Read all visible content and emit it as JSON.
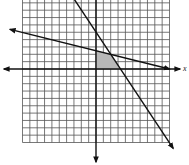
{
  "chart_data": {
    "type": "line",
    "title": "",
    "xlabel": "x",
    "ylabel": "",
    "grid": true,
    "grid_range": {
      "x": [
        -10,
        10
      ],
      "y": [
        -10,
        9
      ]
    },
    "axes": {
      "x_axis": "y=0",
      "y_axis": "x=0"
    },
    "series": [
      {
        "name": "steep line",
        "equation": "y = -1.5x + 5",
        "slope": -1.5,
        "intercept": 5,
        "points": [
          [
            -3.3,
            10
          ],
          [
            10.5,
            -10.8
          ]
        ]
      },
      {
        "name": "shallow line",
        "equation": "y = -0.25x + 2.5",
        "slope": -0.25,
        "intercept": 2.5,
        "points": [
          [
            -11.7,
            5.4
          ],
          [
            10,
            0
          ]
        ]
      }
    ],
    "shaded_region": {
      "description": "feasible region bounded by axes and both lines",
      "vertices": [
        [
          0,
          0
        ],
        [
          0,
          2.5
        ],
        [
          2,
          2
        ],
        [
          3.33,
          0
        ]
      ],
      "color": "#b8b8b8"
    },
    "intersection": [
      2,
      2
    ]
  },
  "labels": {
    "x_axis": "x"
  },
  "colors": {
    "grid": "#555555",
    "line": "#111111",
    "shade": "#b8b8b8",
    "background": "#ffffff"
  }
}
